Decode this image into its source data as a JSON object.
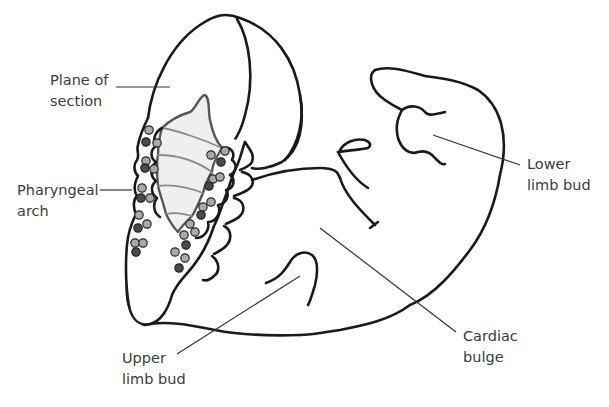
{
  "diagram": {
    "labels": [
      {
        "id": "plane-of-section",
        "lines": [
          "Plane of",
          "section"
        ]
      },
      {
        "id": "pharyngeal-arch",
        "lines": [
          "Pharyngeal",
          "arch"
        ]
      },
      {
        "id": "lower-limb-bud",
        "lines": [
          "Lower",
          "limb bud"
        ]
      },
      {
        "id": "upper-limb-bud",
        "lines": [
          "Upper",
          "limb bud"
        ]
      },
      {
        "id": "cardiac-bulge",
        "lines": [
          "Cardiac",
          "bulge"
        ]
      }
    ],
    "colors": {
      "outline": "#1a1a1a",
      "label_text": "#3b3b3b",
      "leader_line": "#333333",
      "section_fill": "#efefef",
      "dot_light": "#a9a9a9",
      "dot_dark": "#4a4a4a"
    }
  }
}
